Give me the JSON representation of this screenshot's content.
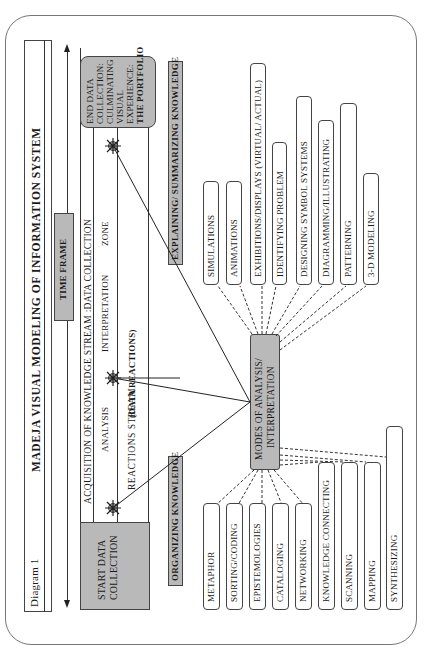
{
  "page_header_cropped": "",
  "title_bar": {
    "label": "Diagram 1",
    "title": "MADEJA  VISUAL MODELING OF INFORMATION  SYSTEM"
  },
  "time_frame": {
    "label": "TIME FRAME"
  },
  "stream": {
    "row1": "ACQUISITION OF  KNOWLEDGE  STREAM :DATA COLLECTION",
    "row2_analysis": "ANALYSIS",
    "row2_interpretation": "INTERPRETATION",
    "row2_zone": "ZONE",
    "row3_reactions": "REACTIONS  STREAM",
    "row3_data_reactions": "(DATA REACTIONS)"
  },
  "start_box": {
    "line1": "START DATA",
    "line2": "COLLECTION"
  },
  "end_box": {
    "line1": "END DATA",
    "line2": "COLLECTION:",
    "line3": "CULMINATING",
    "line4": "VISUAL",
    "line5": "EXPERIENCE:",
    "line6": "THE PORTFOLIO"
  },
  "section_labels": {
    "organizing": "ORGANIZING  KNOWLEDGE",
    "explaining": "EXPLAINING/ SUMMARIZING  KNOWLEDGE"
  },
  "center_box": {
    "line1": "MODES OF ANALYSIS/",
    "line2": "INTERPRETATION"
  },
  "explaining_items": [
    {
      "label": "SIMULATIONS"
    },
    {
      "label": "ANIMATIONS"
    },
    {
      "label": "EXHIBITIONS/DISPLAYS (VIRTUAL/ ACTUAL)"
    },
    {
      "label": "IDENTIFYING PROBLEM"
    },
    {
      "label": "DESIGNING SYMBOL SYSTEMS"
    },
    {
      "label": "DIAGRAMMING/ILLUSTRATING"
    },
    {
      "label": "PATTERNING"
    },
    {
      "label": "3-D MODELING"
    }
  ],
  "organizing_items": [
    {
      "label": "METAPHOR"
    },
    {
      "label": "SORTING/CODING"
    },
    {
      "label": "EPISTEMOLOGIES"
    },
    {
      "label": "CATALOGING"
    },
    {
      "label": "NETWORKING"
    },
    {
      "label": "KNOWLEDGE CONNECTING"
    },
    {
      "label": "SCANNING"
    },
    {
      "label": "MAPPING"
    },
    {
      "label": "SYNTHESIZING"
    }
  ],
  "icons": {
    "star_1": "sun-star-icon",
    "star_2": "sun-star-icon",
    "star_3": "sun-star-icon"
  },
  "colors": {
    "gray_box": "#b9b9b9",
    "line": "#333333",
    "frame": "#777777"
  }
}
